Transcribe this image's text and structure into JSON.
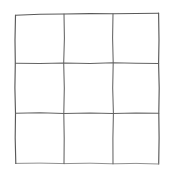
{
  "figure": {
    "kind": "hand-drawn-grid",
    "title": "",
    "caption": "",
    "background_color": "#ffffff",
    "line_color": "#595959",
    "line_color_inner": "#636363",
    "line_color_faint": "#8a8a8a",
    "rows": 3,
    "columns": 3,
    "cell_count": 9,
    "line_style": "hand-drawn, slightly wavy, thin",
    "stroke_width_px": 1.15
  },
  "geometry": {
    "canvas_width": 175,
    "canvas_height": 170,
    "grid_left": 15,
    "grid_top": 14,
    "grid_right": 159,
    "grid_bottom": 164,
    "vertical_divider_x": [
      64,
      113
    ],
    "horizontal_divider_y": [
      63,
      113
    ],
    "cell_width_avg": 48,
    "cell_height_avg": 50
  },
  "paths": {
    "border_top": "M 15.5 15.2 L 40 14.3 L 64 14.0 L 90 13.6 L 113 13.8 L 136 13.5 L 158.6 13.2",
    "border_right": "M 158.6 13.2 L 159.0 40 L 158.6 63.4 L 159.2 88 L 158.8 113.2 L 159.1 138 L 158.7 164.0",
    "border_bottom": "M 158.7 164.0 L 136 163.4 L 113 163.8 L 90 163.2 L 64 163.6 L 40 163.1 L 15.8 163.4",
    "border_left": "M 15.8 163.4 L 15.2 138 L 15.5 113.3 L 14.9 88 L 15.3 63.2 L 15.0 40 L 15.5 15.2",
    "divider_h_1": "M 15.4 63.2 L 40 63.5 L 64 62.9 L 90 63.4 L 113 62.8 L 136 63.3 L 158.7 63.4",
    "divider_h_2": "M 15.5 113.3 L 40 112.8 L 64 113.4 L 90 112.9 L 113 113.5 L 136 113.0 L 158.8 113.2",
    "divider_v_1": "M 64.0 14.0 L 64.4 38 L 63.7 62.9 L 64.3 88 L 63.8 113.4 L 64.2 138 L 64.0 163.6",
    "divider_v_2": "M 113.0 13.8 L 112.6 38 L 113.2 62.8 L 112.7 88 L 113.4 113.5 L 112.9 138 L 113.0 163.8"
  },
  "cells": [
    {
      "id": "cell-r1c1",
      "row": 1,
      "column": 1,
      "content": ""
    },
    {
      "id": "cell-r1c2",
      "row": 1,
      "column": 2,
      "content": ""
    },
    {
      "id": "cell-r1c3",
      "row": 1,
      "column": 3,
      "content": ""
    },
    {
      "id": "cell-r2c1",
      "row": 2,
      "column": 1,
      "content": ""
    },
    {
      "id": "cell-r2c2",
      "row": 2,
      "column": 2,
      "content": ""
    },
    {
      "id": "cell-r2c3",
      "row": 2,
      "column": 3,
      "content": ""
    },
    {
      "id": "cell-r3c1",
      "row": 3,
      "column": 1,
      "content": ""
    },
    {
      "id": "cell-r3c2",
      "row": 3,
      "column": 2,
      "content": ""
    },
    {
      "id": "cell-r3c3",
      "row": 3,
      "column": 3,
      "content": ""
    }
  ]
}
